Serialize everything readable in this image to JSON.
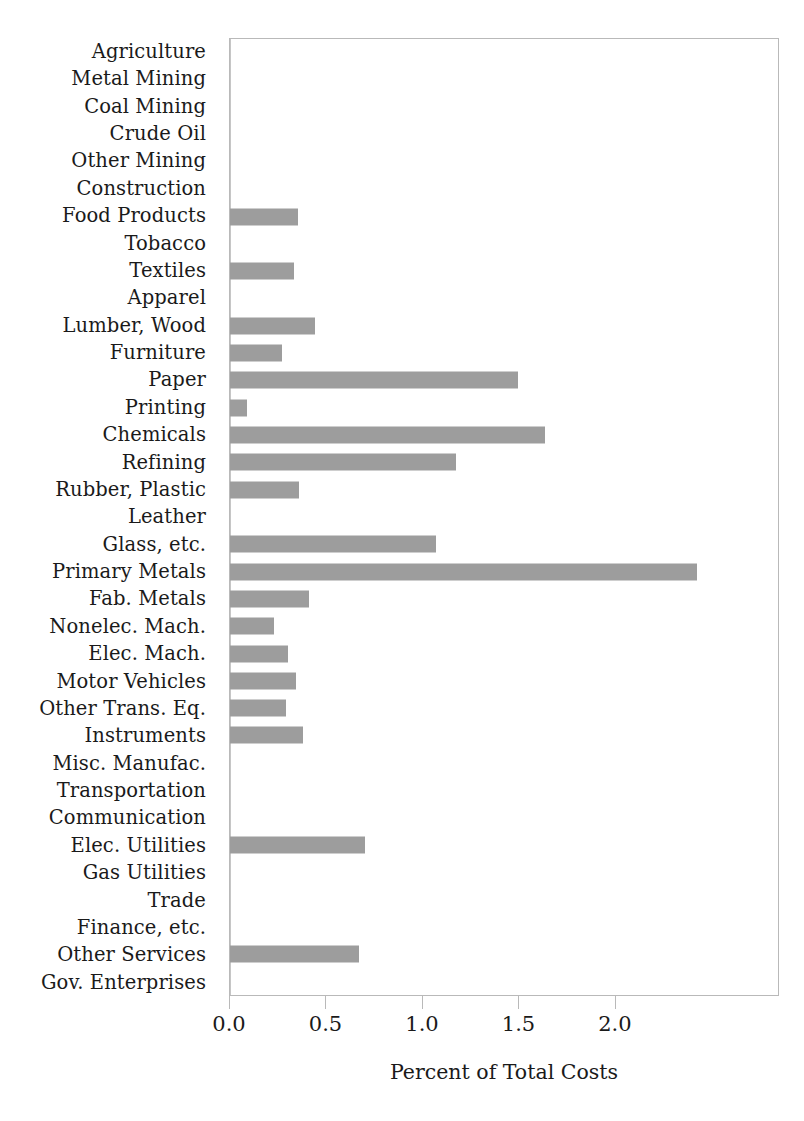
{
  "chart_data": {
    "type": "bar",
    "orientation": "horizontal",
    "title": "",
    "xlabel": "Percent of Total Costs",
    "ylabel": "",
    "xlim": [
      0,
      2.85
    ],
    "xticks": [
      0.0,
      0.5,
      1.0,
      1.5,
      2.0
    ],
    "xticklabels": [
      "0.0",
      "0.5",
      "1.0",
      "1.5",
      "2.0"
    ],
    "grid": false,
    "legend": null,
    "bar_color": "#9d9d9d",
    "categories": [
      "Agriculture",
      "Metal Mining",
      "Coal Mining",
      "Crude Oil",
      "Other Mining",
      "Construction",
      "Food Products",
      "Tobacco",
      "Textiles",
      "Apparel",
      "Lumber, Wood",
      "Furniture",
      "Paper",
      "Printing",
      "Chemicals",
      "Refining",
      "Rubber, Plastic",
      "Leather",
      "Glass, etc.",
      "Primary Metals",
      "Fab. Metals",
      "Nonelec. Mach.",
      "Elec. Mach.",
      "Motor Vehicles",
      "Other Trans. Eq.",
      "Instruments",
      "Misc. Manufac.",
      "Transportation",
      "Communication",
      "Elec. Utilities",
      "Gas Utilities",
      "Trade",
      "Finance, etc.",
      "Other Services",
      "Gov. Enterprises"
    ],
    "values": [
      0.0,
      0.0,
      0.0,
      0.0,
      0.0,
      0.0,
      0.35,
      0.0,
      0.33,
      0.0,
      0.44,
      0.27,
      1.49,
      0.09,
      1.63,
      1.17,
      0.36,
      0.0,
      1.07,
      2.42,
      0.41,
      0.23,
      0.3,
      0.34,
      0.29,
      0.38,
      0.0,
      0.0,
      0.0,
      0.7,
      0.0,
      0.0,
      0.0,
      0.67,
      0.0
    ]
  }
}
